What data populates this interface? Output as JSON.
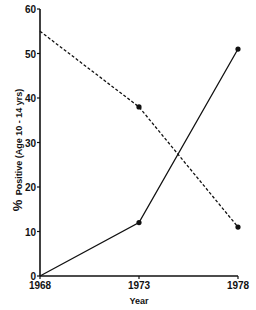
{
  "chart_data": {
    "type": "line",
    "title": "",
    "xlabel": "Year",
    "ylabel": "% Positive (Age 10 - 14 yrs)",
    "ylabel_prefix": "%",
    "ylabel_rest": "Positive (Age 10 - 14 yrs)",
    "x": [
      1968,
      1973,
      1978
    ],
    "xticks": [
      "1968",
      "1973",
      "1978"
    ],
    "xlim": [
      1968,
      1978
    ],
    "ylim": [
      0,
      60
    ],
    "yticks": [
      0,
      10,
      20,
      30,
      40,
      50,
      60
    ],
    "ytick_labels": [
      "0",
      "10",
      "20",
      "30",
      "40",
      "50",
      "60"
    ],
    "grid": false,
    "legend": "none",
    "series": [
      {
        "name": "dashed-series",
        "style": "dashed",
        "values": [
          55,
          38,
          11
        ]
      },
      {
        "name": "solid-series",
        "style": "solid",
        "values": [
          0,
          12,
          51
        ]
      }
    ]
  }
}
